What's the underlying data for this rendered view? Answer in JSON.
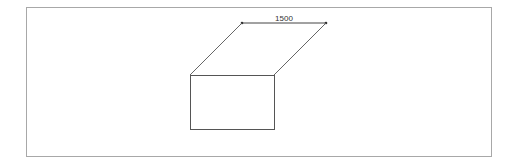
{
  "diagram": {
    "dimension": {
      "label": "1500",
      "x1": 242,
      "y1": 23,
      "x2": 326,
      "y2": 23
    },
    "shape": {
      "type": "box-with-parallelogram-top",
      "rect": {
        "x": 190,
        "y": 75,
        "width": 85,
        "height": 55
      },
      "diagonals": [
        {
          "x1": 242,
          "y1": 23,
          "x2": 190,
          "y2": 75
        },
        {
          "x1": 326,
          "y1": 23,
          "x2": 274,
          "y2": 75
        }
      ]
    },
    "colors": {
      "line": "#555555",
      "frame": "#a8a8a8",
      "background": "#ffffff"
    }
  }
}
